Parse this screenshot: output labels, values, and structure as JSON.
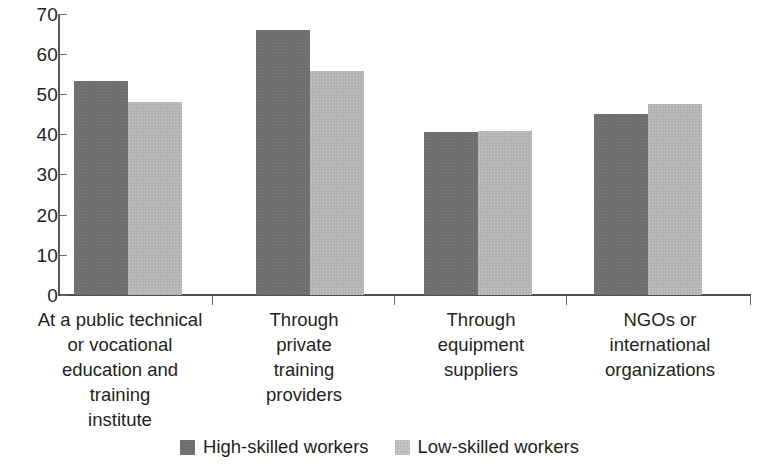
{
  "chart_data": {
    "type": "bar",
    "title": "",
    "subtitle": "",
    "xlabel": "",
    "ylabel": "",
    "ylim": [
      0,
      70
    ],
    "yticks": [
      0,
      10,
      20,
      30,
      40,
      50,
      60,
      70
    ],
    "grid": false,
    "legend_position": "bottom-center",
    "categories": [
      "At a public technical or vocational education and training institute",
      "Through private training providers",
      "Through equipment suppliers",
      "NGOs or international organizations"
    ],
    "category_lines": [
      [
        "At a public technical",
        "or vocational",
        "education and",
        "training",
        "institute"
      ],
      [
        "Through",
        "private",
        "training",
        "providers"
      ],
      [
        "Through",
        "equipment",
        "suppliers"
      ],
      [
        "NGOs or",
        "international",
        "organizations"
      ]
    ],
    "series": [
      {
        "name": "High-skilled workers",
        "color": "#6e6e6e",
        "values": [
          53.2,
          66.0,
          40.5,
          45.1
        ]
      },
      {
        "name": "Low-skilled workers",
        "color": "#b4b4b4",
        "values": [
          48.0,
          55.8,
          40.8,
          47.7
        ]
      }
    ]
  },
  "legend": {
    "items": [
      {
        "label": "High-skilled workers",
        "swatch": "dark"
      },
      {
        "label": "Low-skilled workers",
        "swatch": "light"
      }
    ]
  },
  "axis": {
    "y_tick_labels": [
      "70",
      "60",
      "50",
      "40",
      "30",
      "20",
      "10",
      "0"
    ]
  }
}
